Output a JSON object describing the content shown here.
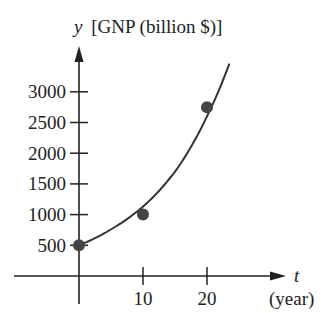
{
  "chart_data": {
    "type": "scatter",
    "title": "",
    "xlabel": "t",
    "xlabel_unit": "(year)",
    "ylabel": "y",
    "ylabel_unit": "[GNP (billion $)]",
    "xlim": [
      -6,
      36
    ],
    "ylim": [
      -200,
      3600
    ],
    "x_ticks": [
      10,
      20
    ],
    "x_tick_labels": [
      "10",
      "20"
    ],
    "y_ticks": [
      500,
      1000,
      1500,
      2000,
      2500,
      3000
    ],
    "y_tick_labels": [
      "500",
      "1000",
      "1500",
      "2000",
      "2500",
      "3000"
    ],
    "grid": false,
    "legend": null,
    "series": [
      {
        "name": "data points",
        "kind": "scatter",
        "x": [
          0,
          10,
          20
        ],
        "y": [
          500,
          1000,
          2750
        ]
      },
      {
        "name": "fitted exponential curve",
        "kind": "line",
        "x": [
          0,
          5,
          10,
          15,
          20,
          23.5
        ],
        "y": [
          500,
          760,
          1130,
          1700,
          2600,
          3460
        ]
      }
    ],
    "colors": {
      "ink": "#222222",
      "point": "#444444"
    }
  },
  "labels": {
    "y_var": "y",
    "y_unit": "[GNP (billion $)]",
    "x_var": "t",
    "x_unit": "(year)"
  }
}
